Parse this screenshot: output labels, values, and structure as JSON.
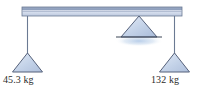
{
  "figure": {
    "background_color": "#ffffff",
    "beam": {
      "name": "horizontal-beam",
      "x": 22,
      "y": 7,
      "width": 160,
      "height": 9,
      "top_strip_color": "#8fa0bd",
      "body_color": "#ccd5e6",
      "edge_color": "#6b7a93"
    },
    "fulcrum": {
      "name": "center-fulcrum-triangle",
      "apex_x": 139,
      "apex_y": 16,
      "base_y": 37,
      "half_width": 18,
      "fill_color": "#c3d2e8",
      "stroke_color": "#55617a",
      "ground_line": {
        "x1": 116,
        "x2": 162,
        "y": 37,
        "color": "#3d4657"
      },
      "shadow_color": "#c7d8ee"
    },
    "hangers": [
      {
        "name": "left-hanger",
        "rod_x": 27,
        "rod_top": 16,
        "rod_bottom": 53,
        "rod_color": "#6b7a93",
        "triangle": {
          "apex_x": 27,
          "apex_y": 53,
          "base_y": 72,
          "half_width": 15,
          "fill_color": "#c3d2e8",
          "stroke_color": "#55617a"
        },
        "label": "45.3 kg",
        "mass_value": 45.3,
        "mass_unit": "kg"
      },
      {
        "name": "right-hanger",
        "rod_x": 174,
        "rod_top": 16,
        "rod_bottom": 53,
        "rod_color": "#6b7a93",
        "triangle": {
          "apex_x": 174,
          "apex_y": 53,
          "base_y": 72,
          "half_width": 15,
          "fill_color": "#c3d2e8",
          "stroke_color": "#55617a"
        },
        "label": "132 kg",
        "mass_value": 132,
        "mass_unit": "kg"
      }
    ]
  }
}
